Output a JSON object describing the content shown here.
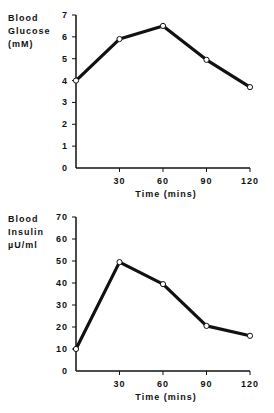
{
  "chart_data": [
    {
      "type": "line",
      "title": "",
      "ylabel_lines": [
        "Blood",
        "Glucose",
        "(mM)"
      ],
      "xlabel": "Time (mins)",
      "x": [
        0,
        30,
        60,
        90,
        120
      ],
      "xticks": [
        "30",
        "60",
        "90",
        "120"
      ],
      "yticks": [
        "0",
        "1",
        "2",
        "3",
        "4",
        "5",
        "6",
        "7"
      ],
      "ylim": [
        0,
        7
      ],
      "xlim": [
        0,
        120
      ],
      "grid": false,
      "series": [
        {
          "name": "Blood Glucose",
          "values": [
            4.0,
            5.9,
            6.5,
            4.95,
            3.7
          ]
        }
      ]
    },
    {
      "type": "line",
      "title": "",
      "ylabel_lines": [
        "Blood",
        "Insulin",
        "µU/ml"
      ],
      "xlabel": "Time (mins)",
      "x": [
        0,
        30,
        60,
        90,
        120
      ],
      "xticks": [
        "30",
        "60",
        "90",
        "120"
      ],
      "yticks": [
        "0",
        "10",
        "20",
        "30",
        "40",
        "50",
        "60",
        "70"
      ],
      "ylim": [
        0,
        70
      ],
      "xlim": [
        0,
        120
      ],
      "grid": false,
      "series": [
        {
          "name": "Blood Insulin",
          "values": [
            10,
            49.5,
            39.5,
            20.5,
            16
          ]
        }
      ]
    }
  ]
}
